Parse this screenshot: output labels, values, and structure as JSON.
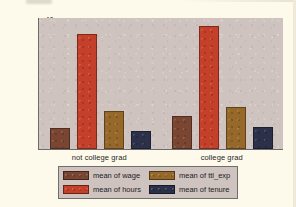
{
  "chart_data": {
    "type": "bar",
    "title": "",
    "xlabel": "",
    "ylabel": "",
    "ylim": [
      0,
      42
    ],
    "yticks": [
      0,
      10,
      20,
      30,
      40
    ],
    "grid": false,
    "legend_position": "bottom",
    "categories": [
      "not college grad",
      "college grad"
    ],
    "series": [
      {
        "name": "mean of wage",
        "values": [
          6.7,
          10.5
        ],
        "color": "#7a4632"
      },
      {
        "name": "mean of hours",
        "values": [
          36.7,
          39.0
        ],
        "color": "#c4402a"
      },
      {
        "name": "mean of ttl_exp",
        "values": [
          12.2,
          13.5
        ],
        "color": "#96682a"
      },
      {
        "name": "mean of tenure",
        "values": [
          5.8,
          6.9
        ],
        "color": "#2c3149"
      }
    ]
  },
  "legend": {
    "entries": [
      {
        "label": "mean of wage",
        "color": "#7a4632"
      },
      {
        "label": "mean of hours",
        "color": "#c4402a"
      },
      {
        "label": "mean of ttl_exp",
        "color": "#96682a"
      },
      {
        "label": "mean of tenure",
        "color": "#2c3149"
      }
    ]
  },
  "colors": {
    "figure_background": "#fdfaec",
    "plot_background": "#cfc3c0",
    "axis": "#6b6b6b",
    "text": "#1f1f1f"
  }
}
